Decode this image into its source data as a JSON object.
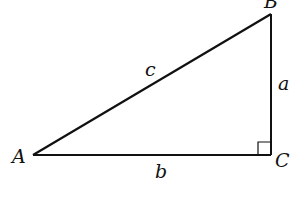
{
  "diagram": {
    "type": "right-triangle",
    "vertices": {
      "A": {
        "label": "A",
        "x": 33,
        "y": 155
      },
      "B": {
        "label": "B",
        "x": 271,
        "y": 14
      },
      "C": {
        "label": "C",
        "x": 271,
        "y": 155
      }
    },
    "sides": {
      "a": {
        "label": "a",
        "from": "B",
        "to": "C"
      },
      "b": {
        "label": "b",
        "from": "A",
        "to": "C"
      },
      "c": {
        "label": "c",
        "from": "A",
        "to": "B"
      }
    },
    "right_angle_at": "C",
    "colors": {
      "stroke": "#111111",
      "background": "#ffffff"
    }
  }
}
